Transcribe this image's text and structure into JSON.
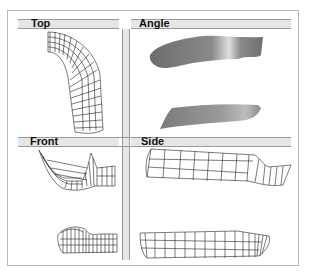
{
  "panels": [
    {
      "id": "top",
      "label": "Top",
      "content": "wireframe-mesh"
    },
    {
      "id": "angle",
      "label": "Angle",
      "content": "shaded-surface"
    },
    {
      "id": "front",
      "label": "Front",
      "content": "wireframe-mesh"
    },
    {
      "id": "side",
      "label": "Side",
      "content": "wireframe-mesh"
    }
  ],
  "colors": {
    "frame": "#b8b8b8",
    "divider": "#9a9a9a",
    "divider_fill": "#e6e6e6",
    "wire": "#222222",
    "surface": "#7a7a7a",
    "highlight": "#d8d8d8"
  }
}
